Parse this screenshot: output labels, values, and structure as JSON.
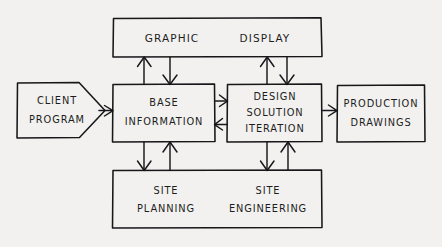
{
  "diagram": {
    "style": "hand-drawn pencil sketch on paper",
    "background_color": "#f2f1ef",
    "ink_color": "#17171a",
    "nodes": [
      {
        "id": "client-program",
        "shape": "pentagon-arrow",
        "lines": [
          "CLIENT",
          "PROGRAM"
        ],
        "line1": "CLIENT",
        "line2": "PROGRAM"
      },
      {
        "id": "graphic-display",
        "shape": "rectangle",
        "lines": [
          "GRAPHIC    DISPLAY"
        ],
        "line1": "GRAPHIC",
        "line2": "DISPLAY"
      },
      {
        "id": "base-information",
        "shape": "rectangle",
        "lines": [
          "BASE",
          "INFORMATION"
        ],
        "line1": "BASE",
        "line2": "INFORMATION"
      },
      {
        "id": "design-solution-iteration",
        "shape": "rectangle",
        "lines": [
          "DESIGN",
          "SOLUTION",
          "ITERATION"
        ],
        "line1": "DESIGN",
        "line2": "SOLUTION",
        "line3": "ITERATION"
      },
      {
        "id": "production-drawings",
        "shape": "rectangle",
        "lines": [
          "PRODUCTION",
          "DRAWINGS"
        ],
        "line1": "PRODUCTION",
        "line2": "DRAWINGS"
      },
      {
        "id": "site-planning",
        "shape": "rectangle-half",
        "lines": [
          "SITE",
          "PLANNING"
        ],
        "line1": "SITE",
        "line2": "PLANNING"
      },
      {
        "id": "site-engineering",
        "shape": "rectangle-half",
        "lines": [
          "SITE",
          "ENGINEERING"
        ],
        "line1": "SITE",
        "line2": "ENGINEERING"
      }
    ],
    "connections": [
      {
        "id": "client-to-base",
        "from": "client-program",
        "to": "base-information",
        "direction": "right"
      },
      {
        "id": "base-to-graphic",
        "from": "base-information",
        "to": "graphic-display",
        "direction": "up"
      },
      {
        "id": "graphic-to-base",
        "from": "graphic-display",
        "to": "base-information",
        "direction": "down"
      },
      {
        "id": "design-to-graphic",
        "from": "design-solution-iteration",
        "to": "graphic-display",
        "direction": "up"
      },
      {
        "id": "graphic-to-design",
        "from": "graphic-display",
        "to": "design-solution-iteration",
        "direction": "down"
      },
      {
        "id": "base-to-design",
        "from": "base-information",
        "to": "design-solution-iteration",
        "direction": "right"
      },
      {
        "id": "design-to-base",
        "from": "design-solution-iteration",
        "to": "base-information",
        "direction": "left"
      },
      {
        "id": "base-to-siteplanning",
        "from": "base-information",
        "to": "site-planning",
        "direction": "down"
      },
      {
        "id": "siteplanning-to-base",
        "from": "site-planning",
        "to": "base-information",
        "direction": "up"
      },
      {
        "id": "design-to-siteengineering",
        "from": "design-solution-iteration",
        "to": "site-engineering",
        "direction": "down"
      },
      {
        "id": "siteengineering-to-design",
        "from": "site-engineering",
        "to": "design-solution-iteration",
        "direction": "up"
      },
      {
        "id": "design-to-production",
        "from": "design-solution-iteration",
        "to": "production-drawings",
        "direction": "right"
      }
    ]
  }
}
